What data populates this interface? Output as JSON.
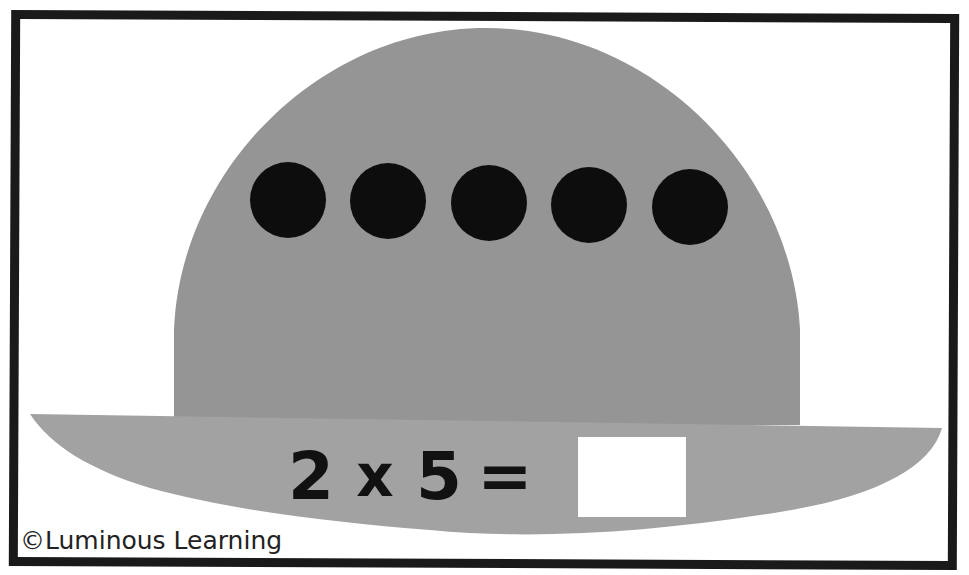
{
  "card": {
    "border_color": "#1a1a1a",
    "background": "#ffffff"
  },
  "hat": {
    "crown_color": "#959595",
    "brim_color": "#a2a2a2",
    "dot_color": "#0d0d0d",
    "dot_count": 5
  },
  "equation": {
    "factor_a": "2",
    "operator": "x",
    "factor_b": "5",
    "equals": "=",
    "answer": ""
  },
  "credit": "©Luminous Learning"
}
